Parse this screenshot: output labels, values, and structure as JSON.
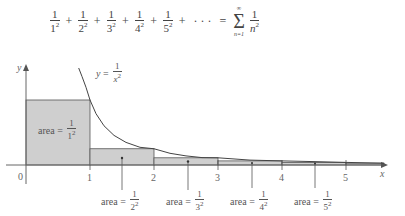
{
  "formula": {
    "terms": [
      {
        "num": "1",
        "base": "1",
        "exp": "2"
      },
      {
        "num": "1",
        "base": "2",
        "exp": "2"
      },
      {
        "num": "1",
        "base": "3",
        "exp": "2"
      },
      {
        "num": "1",
        "base": "4",
        "exp": "2"
      },
      {
        "num": "1",
        "base": "5",
        "exp": "2"
      }
    ],
    "plus": "+",
    "ellipsis": "· · ·",
    "equals": "=",
    "sigma": "Σ",
    "sigma_upper": "∞",
    "sigma_lower": "n=1",
    "rhs_num": "1",
    "rhs_base": "n",
    "rhs_exp": "2"
  },
  "graph": {
    "y_axis_label": "y",
    "x_axis_label": "x",
    "origin_label": "0",
    "x_ticks": [
      "1",
      "2",
      "3",
      "4",
      "5"
    ],
    "curve_label": {
      "lhs": "y",
      "eq": "=",
      "num": "1",
      "den_base": "x",
      "den_exp": "2"
    },
    "area_word": "area",
    "area_eq": "=",
    "areas": [
      {
        "num": "1",
        "base": "1",
        "exp": "2"
      },
      {
        "num": "1",
        "base": "2",
        "exp": "2"
      },
      {
        "num": "1",
        "base": "3",
        "exp": "2"
      },
      {
        "num": "1",
        "base": "4",
        "exp": "2"
      },
      {
        "num": "1",
        "base": "5",
        "exp": "2"
      }
    ],
    "colors": {
      "rect_fill": "#cfcfcf",
      "rect_stroke": "#555555",
      "curve": "#444444",
      "axis": "#666666"
    }
  }
}
